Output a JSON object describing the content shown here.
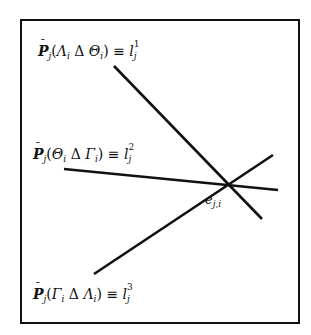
{
  "diagram": {
    "frame": {
      "x": 20,
      "y": 19,
      "width": 278,
      "height": 303,
      "stroke": "#111111"
    },
    "intersection_point": {
      "x": 230,
      "y": 184,
      "label_base": "e",
      "label_sub": "j,i"
    },
    "lines": [
      {
        "id": "l1",
        "x1": 114,
        "y1": 66,
        "x2": 262,
        "y2": 219
      },
      {
        "id": "l2",
        "x1": 64,
        "y1": 169,
        "x2": 278,
        "y2": 190
      },
      {
        "id": "l3",
        "x1": 94,
        "y1": 274,
        "x2": 273,
        "y2": 155
      }
    ],
    "labels": [
      {
        "id": "label-l1",
        "operator": "P",
        "operator_sub": "j",
        "open": "(",
        "set_a": "Λ",
        "set_a_sub": "i",
        "op": "Δ",
        "set_b": "Θ",
        "set_b_sub": "i",
        "close": ")",
        "equiv": "≡",
        "line_var": "l",
        "line_sup": "1",
        "line_sub": "j"
      },
      {
        "id": "label-l2",
        "operator": "P",
        "operator_sub": "j",
        "open": "(",
        "set_a": "Θ",
        "set_a_sub": "i",
        "op": "Δ",
        "set_b": "Γ",
        "set_b_sub": "i",
        "close": ")",
        "equiv": "≡",
        "line_var": "l",
        "line_sup": "2",
        "line_sub": "j"
      },
      {
        "id": "label-l3",
        "operator": "P",
        "operator_sub": "j",
        "open": "(",
        "set_a": "Γ",
        "set_a_sub": "i",
        "op": "Δ",
        "set_b": "Λ",
        "set_b_sub": "i",
        "close": ")",
        "equiv": "≡",
        "line_var": "l",
        "line_sup": "3",
        "line_sub": "j"
      }
    ],
    "bar_glyph": "¯"
  }
}
